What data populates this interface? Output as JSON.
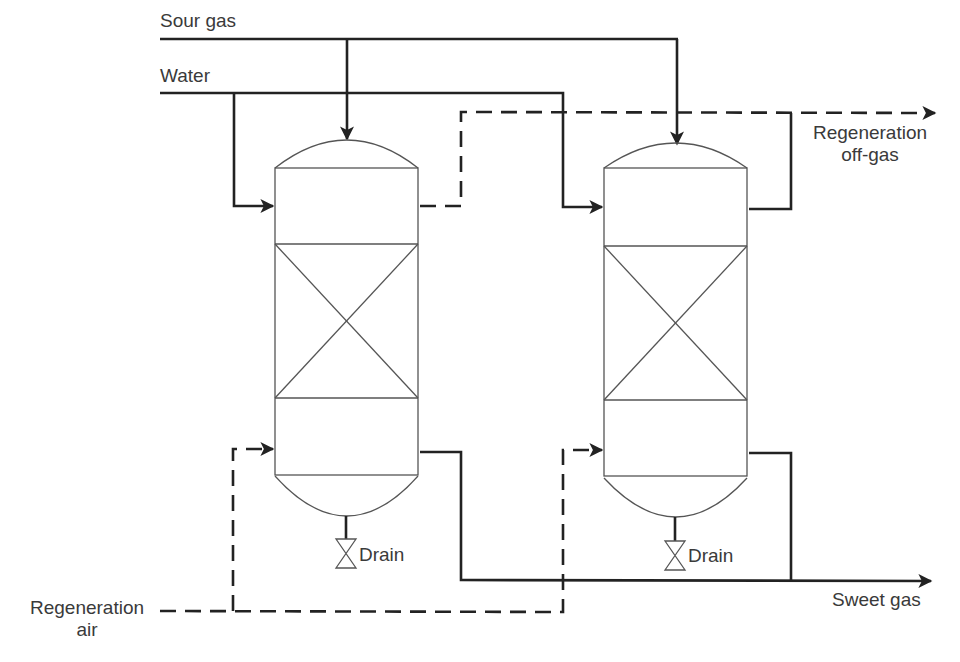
{
  "diagram": {
    "type": "process-flow-diagram",
    "streams": {
      "sour_gas": "Sour gas",
      "water": "Water",
      "regen_offgas_line1": "Regeneration",
      "regen_offgas_line2": "off-gas",
      "regen_air_line1": "Regeneration",
      "regen_air_line2": "air",
      "sweet_gas": "Sweet gas"
    },
    "columns": [
      {
        "id": "column-1",
        "drain_label": "Drain",
        "sections": [
          "top-head",
          "upper-chamber",
          "packed-bed",
          "lower-chamber",
          "bottom-head"
        ]
      },
      {
        "id": "column-2",
        "drain_label": "Drain",
        "sections": [
          "top-head",
          "upper-chamber",
          "packed-bed",
          "lower-chamber",
          "bottom-head"
        ]
      }
    ],
    "line_styles": {
      "process": "solid",
      "regeneration": "dashed"
    },
    "colors": {
      "line": "#222222",
      "vessel": "#555555",
      "text": "#3a3a3a",
      "background": "#ffffff"
    }
  }
}
